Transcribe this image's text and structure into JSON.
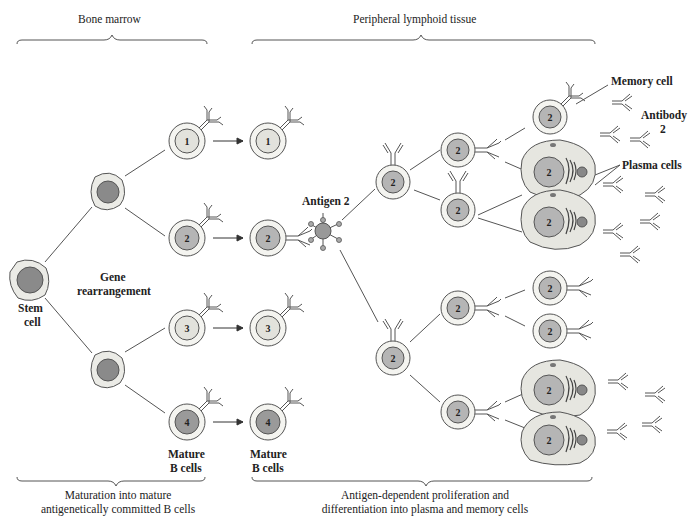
{
  "diagram": {
    "title_sections": {
      "bone_marrow": "Bone marrow",
      "peripheral": "Peripheral lymphoid tissue"
    },
    "labels": {
      "stem_cell_1": "Stem",
      "stem_cell_2": "cell",
      "gene_1": "Gene",
      "gene_2": "rearrangement",
      "mature_a_1": "Mature",
      "mature_a_2": "B cells",
      "mature_b_1": "Mature",
      "mature_b_2": "B cells",
      "antigen": "Antigen 2",
      "memory_cell": "Memory cell",
      "antibody_1": "Antibody",
      "antibody_2": "2",
      "plasma_cells": "Plasma cells"
    },
    "bottom_captions": {
      "left_1": "Maturation into mature",
      "left_2": "antigenetically committed B cells",
      "right_1": "Antigen-dependent proliferation and",
      "right_2": "differentiation into plasma and memory cells"
    },
    "cell_numbers": {
      "b1": "1",
      "b2": "2",
      "b3": "3",
      "b4": "4",
      "m1": "1",
      "m2": "2",
      "m3": "3",
      "m4": "4",
      "clone": "2"
    },
    "colors": {
      "outline": "#555555",
      "cytoplasm": "#ebebe6",
      "nucleus_dark": "#8a8a8a",
      "nucleus_mid": "#b5b5b5",
      "nucleus_light": "#dcdcdc",
      "plasma_fill": "#e6e6e0"
    }
  }
}
